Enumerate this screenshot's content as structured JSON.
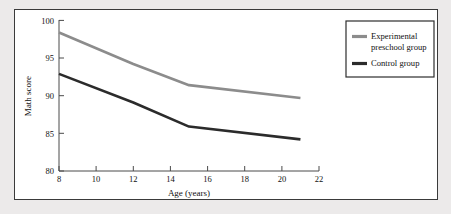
{
  "figure": {
    "background_color": "#eceaea",
    "panel_color": "#ffffff",
    "border_color": "#3a3a3a"
  },
  "chart_data": {
    "type": "line",
    "title": "",
    "xlabel": "Age (years)",
    "ylabel": "Math score",
    "xlim": [
      8,
      22
    ],
    "ylim": [
      80,
      100
    ],
    "xticks": [
      8,
      10,
      12,
      14,
      16,
      18,
      20,
      22
    ],
    "xtick_labels": [
      "8",
      "10",
      "12",
      "14",
      "16",
      "18",
      "20",
      "22"
    ],
    "yticks": [
      80,
      85,
      90,
      95,
      100
    ],
    "ytick_labels": [
      "80",
      "85",
      "90",
      "95",
      "100"
    ],
    "grid": false,
    "legend_position": "upper right outside",
    "x": [
      8,
      12,
      15,
      21
    ],
    "series": [
      {
        "name": "Experimental preschool group",
        "color": "#8c8c8c",
        "values": [
          98.4,
          94.2,
          91.4,
          89.7
        ]
      },
      {
        "name": "Control group",
        "color": "#2b2b2b",
        "values": [
          92.9,
          89.1,
          85.9,
          84.2
        ]
      }
    ]
  },
  "legend": {
    "entries": [
      {
        "label_line1": "Experimental",
        "label_line2": "preschool group",
        "color": "#8c8c8c"
      },
      {
        "label_line1": "Control group",
        "label_line2": "",
        "color": "#2b2b2b"
      }
    ]
  }
}
